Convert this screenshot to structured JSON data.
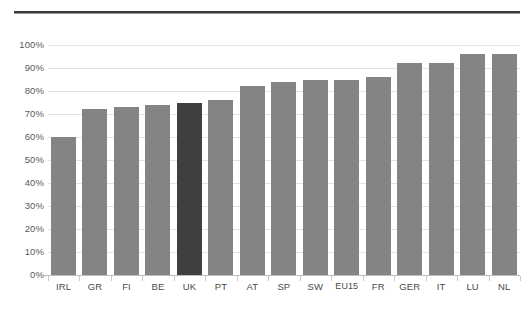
{
  "chart_data": {
    "type": "bar",
    "title": "",
    "subtitle": "",
    "xlabel": "",
    "ylabel": "",
    "ylim": [
      0,
      100
    ],
    "grid": true,
    "legend": "none",
    "y_tick_labels": [
      "100%",
      "90%",
      "80%",
      "70%",
      "60%",
      "50%",
      "40%",
      "30%",
      "20%",
      "10%",
      "0%"
    ],
    "y_tick_values": [
      100,
      90,
      80,
      70,
      60,
      50,
      40,
      30,
      20,
      10,
      0
    ],
    "categories": [
      "IRL",
      "GR",
      "FI",
      "BE",
      "UK",
      "PT",
      "AT",
      "SP",
      "SW",
      "EU15",
      "FR",
      "GER",
      "IT",
      "LU",
      "NL"
    ],
    "values": [
      60,
      72,
      73,
      74,
      75,
      76,
      82,
      84,
      85,
      85,
      86,
      92,
      92,
      96,
      96
    ],
    "highlight_category": "UK",
    "series": [
      {
        "name": "share",
        "values": [
          60,
          72,
          73,
          74,
          75,
          76,
          82,
          84,
          85,
          85,
          86,
          92,
          92,
          96,
          96
        ]
      }
    ],
    "colors": {
      "bar": "#848484",
      "bar_highlight": "#3f3f3f",
      "gridline": "#e2e2e2",
      "axis_text": "#5a5a5a",
      "top_rule": "#3a3a3a"
    }
  }
}
